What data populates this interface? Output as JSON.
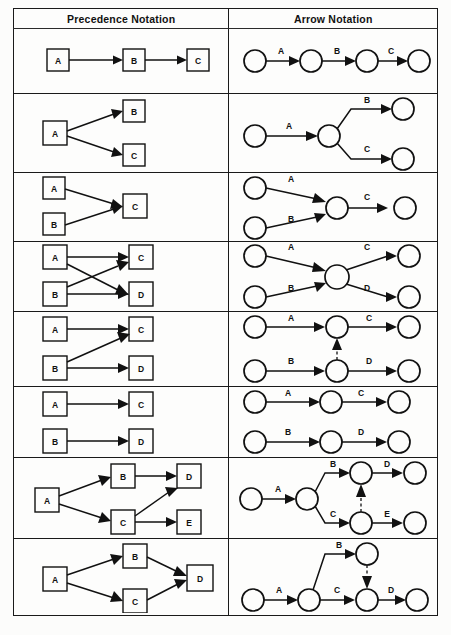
{
  "table": {
    "headers": [
      "Precedence Notation",
      "Arrow Notation"
    ],
    "rows": [
      {
        "id": "row-1",
        "precedence": {
          "nodes": [
            "A",
            "B",
            "C"
          ],
          "edges": [
            [
              "A",
              "B"
            ],
            [
              "B",
              "C"
            ]
          ],
          "description": "Serial chain A then B then C"
        },
        "arrow": {
          "activities": [
            "A",
            "B",
            "C"
          ],
          "events": 4,
          "dummies": 0,
          "description": "Four events chained by activities A, B, C"
        }
      },
      {
        "id": "row-2",
        "precedence": {
          "nodes": [
            "A",
            "B",
            "C"
          ],
          "edges": [
            [
              "A",
              "B"
            ],
            [
              "A",
              "C"
            ]
          ],
          "description": "A precedes both B and C (burst)"
        },
        "activities": [
          "A",
          "B",
          "C"
        ],
        "arrow": {
          "activities": [
            "A",
            "B",
            "C"
          ],
          "events": 4,
          "dummies": 0,
          "description": "A splits into parallel activities B and C"
        }
      },
      {
        "id": "row-3",
        "precedence": {
          "nodes": [
            "A",
            "B",
            "C"
          ],
          "edges": [
            [
              "A",
              "C"
            ],
            [
              "B",
              "C"
            ]
          ],
          "description": "A and B both precede C (merge)"
        },
        "arrow": {
          "activities": [
            "A",
            "B",
            "C"
          ],
          "events": 4,
          "dummies": 0,
          "description": "A and B merge into a single event, then C"
        }
      },
      {
        "id": "row-4",
        "precedence": {
          "nodes": [
            "A",
            "B",
            "C",
            "D"
          ],
          "edges": [
            [
              "A",
              "C"
            ],
            [
              "A",
              "D"
            ],
            [
              "B",
              "C"
            ],
            [
              "B",
              "D"
            ]
          ],
          "description": "A and B each precede both C and D (crossing)"
        },
        "arrow": {
          "activities": [
            "A",
            "B",
            "C",
            "D"
          ],
          "events": 5,
          "dummies": 0,
          "description": "A and B merge at one event which bursts to C and D"
        }
      },
      {
        "id": "row-5",
        "precedence": {
          "nodes": [
            "A",
            "B",
            "C",
            "D"
          ],
          "edges": [
            [
              "A",
              "C"
            ],
            [
              "B",
              "C"
            ],
            [
              "B",
              "D"
            ]
          ],
          "description": "A precedes C; B precedes both C and D"
        },
        "arrow": {
          "activities": [
            "A",
            "B",
            "C",
            "D"
          ],
          "events": 6,
          "dummies": 1,
          "dummy_direction": "up",
          "description": "Dummy arrow points upward from B's event to A's event"
        }
      },
      {
        "id": "row-6",
        "precedence": {
          "nodes": [
            "A",
            "B",
            "C",
            "D"
          ],
          "edges": [
            [
              "A",
              "C"
            ],
            [
              "B",
              "D"
            ]
          ],
          "description": "Two independent chains A to C and B to D"
        },
        "arrow": {
          "activities": [
            "A",
            "B",
            "C",
            "D"
          ],
          "events": 6,
          "dummies": 0,
          "description": "Two separate parallel chains with no interaction"
        }
      },
      {
        "id": "row-7",
        "precedence": {
          "nodes": [
            "A",
            "B",
            "C",
            "D",
            "E"
          ],
          "edges": [
            [
              "A",
              "B"
            ],
            [
              "A",
              "C"
            ],
            [
              "B",
              "D"
            ],
            [
              "C",
              "D"
            ],
            [
              "C",
              "E"
            ]
          ],
          "description": "A precedes B and C; B and C precede D; C precedes E"
        },
        "arrow": {
          "activities": [
            "A",
            "B",
            "C",
            "D",
            "E"
          ],
          "events": 7,
          "dummies": 1,
          "dummy_direction": "up",
          "description": "Dummy arrow points upward from C's event to B's event"
        }
      },
      {
        "id": "row-8",
        "precedence": {
          "nodes": [
            "A",
            "B",
            "C",
            "D"
          ],
          "edges": [
            [
              "A",
              "B"
            ],
            [
              "A",
              "C"
            ],
            [
              "B",
              "D"
            ],
            [
              "C",
              "D"
            ]
          ],
          "description": "A precedes B and C; B and C both precede D"
        },
        "arrow": {
          "activities": [
            "A",
            "B",
            "C",
            "D"
          ],
          "events": 6,
          "dummies": 1,
          "dummy_direction": "down",
          "description": "Dummy arrow points downward from B's event into C's event"
        }
      }
    ]
  },
  "caption": ""
}
